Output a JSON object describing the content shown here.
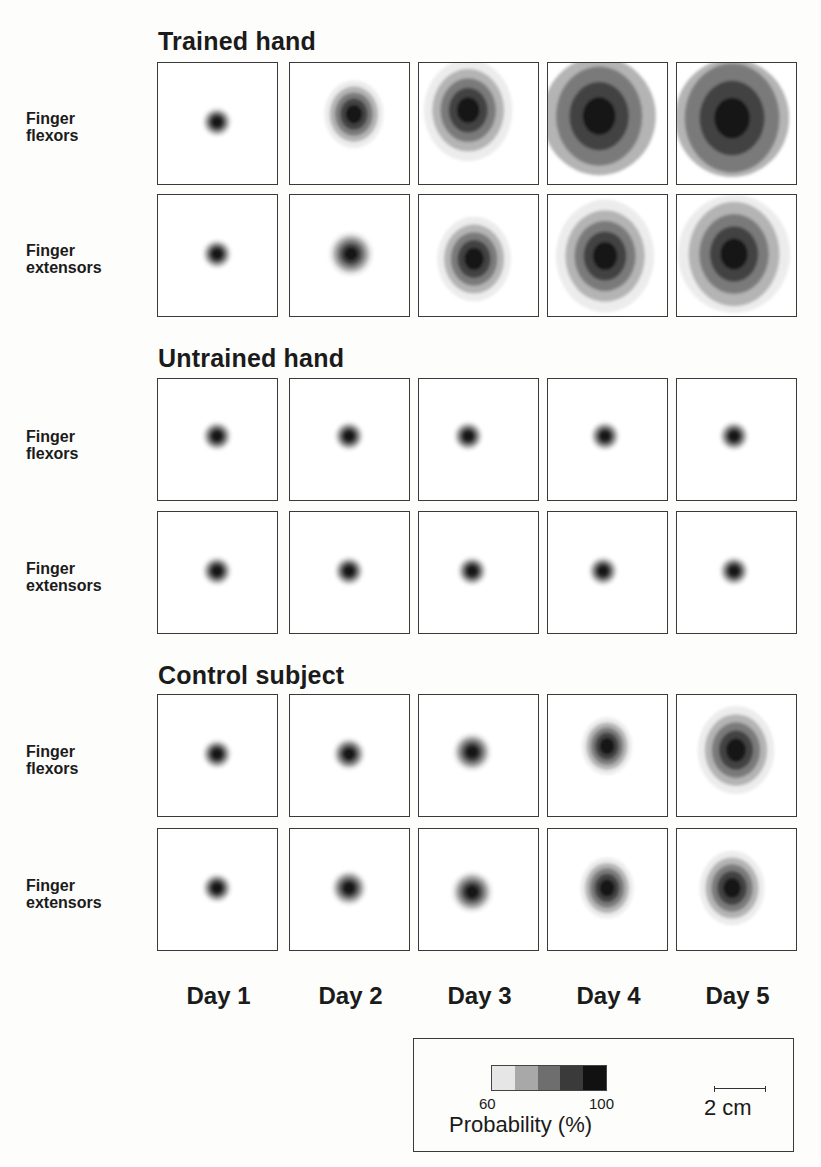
{
  "figure": {
    "sections": [
      {
        "title": "Trained hand"
      },
      {
        "title": "Untrained hand"
      },
      {
        "title": "Control subject"
      }
    ],
    "row_labels": [
      {
        "line1": "Finger",
        "line2": "flexors"
      },
      {
        "line1": "Finger",
        "line2": "extensors"
      }
    ],
    "days": [
      "Day 1",
      "Day 2",
      "Day 3",
      "Day 4",
      "Day 5"
    ],
    "legend": {
      "colorbar_min": "60",
      "colorbar_max": "100",
      "colorbar_label": "Probability (%)",
      "colorbar_colors": [
        "#e6e6e6",
        "#a8a8a8",
        "#6e6e6e",
        "#3a3a3a",
        "#111111"
      ],
      "scale_bar_label": "2 cm"
    }
  },
  "chart_data": {
    "type": "heatmap",
    "xlabel": "Day",
    "categories": [
      "Day 1",
      "Day 2",
      "Day 3",
      "Day 4",
      "Day 5"
    ],
    "rows": [
      "Finger flexors",
      "Finger extensors"
    ],
    "groups": [
      "Trained hand",
      "Untrained hand",
      "Control subject"
    ],
    "colorbar": {
      "label": "Probability (%)",
      "min": 60,
      "max": 100,
      "levels": 5
    },
    "scale": "2 cm",
    "relative_map_size": {
      "Trained hand": {
        "Finger flexors": [
          1,
          2,
          3,
          5,
          5.5
        ],
        "Finger extensors": [
          1,
          1.5,
          2.5,
          3.5,
          4
        ]
      },
      "Untrained hand": {
        "Finger flexors": [
          1,
          1,
          1,
          1,
          1
        ],
        "Finger extensors": [
          1,
          1,
          1,
          1,
          1
        ]
      },
      "Control subject": {
        "Finger flexors": [
          1,
          1.1,
          1.3,
          1.7,
          2.6
        ],
        "Finger extensors": [
          1,
          1.2,
          1.4,
          1.8,
          2.2
        ]
      }
    }
  }
}
